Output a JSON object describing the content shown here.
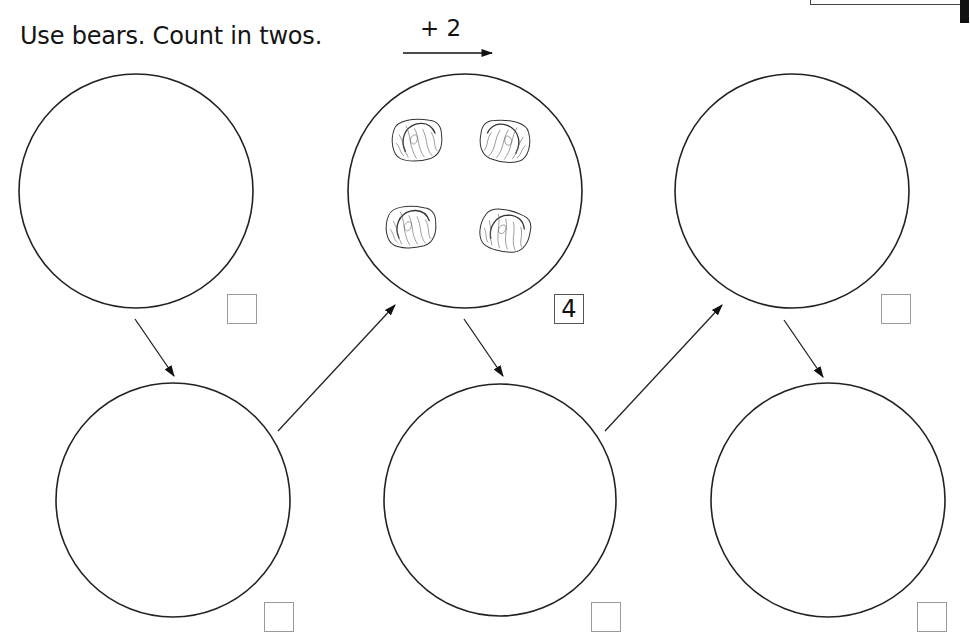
{
  "worksheet": {
    "instruction": "Use bears. Count in twos.",
    "step_label": "+ 2",
    "step_value": 2,
    "sets": [
      {
        "id": 1,
        "row": "top",
        "bears": 0,
        "answer": ""
      },
      {
        "id": 2,
        "row": "bottom",
        "bears": 0,
        "answer": ""
      },
      {
        "id": 3,
        "row": "top",
        "bears": 4,
        "answer": "4"
      },
      {
        "id": 4,
        "row": "bottom",
        "bears": 0,
        "answer": ""
      },
      {
        "id": 5,
        "row": "top",
        "bears": 0,
        "answer": ""
      },
      {
        "id": 6,
        "row": "bottom",
        "bears": 0,
        "answer": ""
      }
    ],
    "icons": {
      "counter": "bear-counter-icon",
      "flow": "arrow-icon"
    },
    "colors": {
      "ink": "#111111",
      "box_border": "#9a9a9a",
      "background": "#ffffff"
    }
  }
}
